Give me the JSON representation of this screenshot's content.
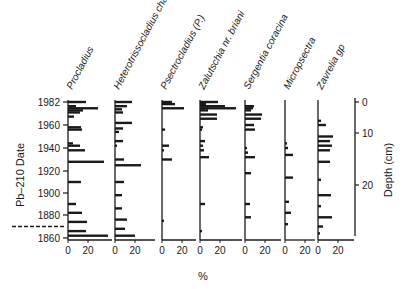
{
  "chart_data": {
    "type": "bar",
    "subtype": "stratigraphic-horizontal-bar",
    "title": "",
    "xlabel": "%",
    "ylabel_left": "Pb–210 Date",
    "ylabel_right": "Depth (cm)",
    "y_ticks_left": [
      1982,
      1960,
      1940,
      1920,
      1900,
      1880,
      1860
    ],
    "y_ticks_right": [
      0,
      10,
      20
    ],
    "x_ticks": [
      0,
      20
    ],
    "dashed_marker_year": 1870,
    "series": [
      {
        "name": "Procladius",
        "values": [
          {
            "year": 1982,
            "pct": 18
          },
          {
            "year": 1978,
            "pct": 8
          },
          {
            "year": 1976,
            "pct": 30
          },
          {
            "year": 1974,
            "pct": 15
          },
          {
            "year": 1972,
            "pct": 12
          },
          {
            "year": 1968,
            "pct": 6
          },
          {
            "year": 1958,
            "pct": 13
          },
          {
            "year": 1956,
            "pct": 14
          },
          {
            "year": 1944,
            "pct": 5
          },
          {
            "year": 1942,
            "pct": 12
          },
          {
            "year": 1938,
            "pct": 17
          },
          {
            "year": 1928,
            "pct": 36
          },
          {
            "year": 1910,
            "pct": 13
          },
          {
            "year": 1890,
            "pct": 8
          },
          {
            "year": 1882,
            "pct": 14
          },
          {
            "year": 1874,
            "pct": 19
          },
          {
            "year": 1866,
            "pct": 18
          },
          {
            "year": 1862,
            "pct": 40
          }
        ]
      },
      {
        "name": "Heterotrissocladius changi",
        "values": [
          {
            "year": 1982,
            "pct": 17
          },
          {
            "year": 1978,
            "pct": 12
          },
          {
            "year": 1975,
            "pct": 7
          },
          {
            "year": 1972,
            "pct": 8
          },
          {
            "year": 1962,
            "pct": 17
          },
          {
            "year": 1957,
            "pct": 8
          },
          {
            "year": 1954,
            "pct": 4
          },
          {
            "year": 1946,
            "pct": 8
          },
          {
            "year": 1942,
            "pct": 2
          },
          {
            "year": 1930,
            "pct": 9
          },
          {
            "year": 1925,
            "pct": 26
          },
          {
            "year": 1910,
            "pct": 9
          },
          {
            "year": 1898,
            "pct": 7
          },
          {
            "year": 1886,
            "pct": 7
          },
          {
            "year": 1876,
            "pct": 12
          },
          {
            "year": 1868,
            "pct": 10
          },
          {
            "year": 1862,
            "pct": 20
          }
        ]
      },
      {
        "name": "Psectrocladius (P.)",
        "values": [
          {
            "year": 1982,
            "pct": 10
          },
          {
            "year": 1980,
            "pct": 13
          },
          {
            "year": 1976,
            "pct": 22
          },
          {
            "year": 1956,
            "pct": 3
          },
          {
            "year": 1942,
            "pct": 7
          },
          {
            "year": 1938,
            "pct": 2
          },
          {
            "year": 1930,
            "pct": 10
          },
          {
            "year": 1875,
            "pct": 2
          }
        ]
      },
      {
        "name": "Zalutschia nr. briani",
        "values": [
          {
            "year": 1982,
            "pct": 18
          },
          {
            "year": 1980,
            "pct": 6
          },
          {
            "year": 1978,
            "pct": 25
          },
          {
            "year": 1976,
            "pct": 36
          },
          {
            "year": 1974,
            "pct": 8
          },
          {
            "year": 1970,
            "pct": 17
          },
          {
            "year": 1966,
            "pct": 17
          },
          {
            "year": 1958,
            "pct": 3
          },
          {
            "year": 1956,
            "pct": 2
          },
          {
            "year": 1946,
            "pct": 5
          },
          {
            "year": 1942,
            "pct": 3
          },
          {
            "year": 1938,
            "pct": 4
          },
          {
            "year": 1932,
            "pct": 9
          },
          {
            "year": 1890,
            "pct": 5
          },
          {
            "year": 1866,
            "pct": 2
          }
        ]
      },
      {
        "name": "Sergentia coracina",
        "values": [
          {
            "year": 1978,
            "pct": 9
          },
          {
            "year": 1976,
            "pct": 8
          },
          {
            "year": 1974,
            "pct": 6
          },
          {
            "year": 1970,
            "pct": 17
          },
          {
            "year": 1966,
            "pct": 16
          },
          {
            "year": 1960,
            "pct": 9
          },
          {
            "year": 1956,
            "pct": 10
          },
          {
            "year": 1940,
            "pct": 2
          },
          {
            "year": 1936,
            "pct": 3
          },
          {
            "year": 1932,
            "pct": 10
          },
          {
            "year": 1918,
            "pct": 6
          },
          {
            "year": 1890,
            "pct": 5
          },
          {
            "year": 1878,
            "pct": 6
          }
        ]
      },
      {
        "name": "Micropsectra",
        "values": [
          {
            "year": 1944,
            "pct": 2
          },
          {
            "year": 1940,
            "pct": 3
          },
          {
            "year": 1934,
            "pct": 8
          },
          {
            "year": 1914,
            "pct": 8
          },
          {
            "year": 1892,
            "pct": 4
          },
          {
            "year": 1882,
            "pct": 6
          },
          {
            "year": 1872,
            "pct": 3
          }
        ]
      },
      {
        "name": "Zavrelia gp",
        "values": [
          {
            "year": 1964,
            "pct": 3
          },
          {
            "year": 1960,
            "pct": 8
          },
          {
            "year": 1950,
            "pct": 15
          },
          {
            "year": 1946,
            "pct": 12
          },
          {
            "year": 1942,
            "pct": 14
          },
          {
            "year": 1938,
            "pct": 12
          },
          {
            "year": 1928,
            "pct": 12
          },
          {
            "year": 1912,
            "pct": 3
          },
          {
            "year": 1898,
            "pct": 13
          },
          {
            "year": 1888,
            "pct": 3
          },
          {
            "year": 1878,
            "pct": 14
          },
          {
            "year": 1870,
            "pct": 5
          },
          {
            "year": 1864,
            "pct": 2
          }
        ]
      }
    ],
    "grid": false,
    "legend": "none"
  },
  "labels": {
    "left_axis_title": "Pb–210 Date",
    "right_axis_title": "Depth (cm)",
    "bottom_axis_title": "%"
  }
}
